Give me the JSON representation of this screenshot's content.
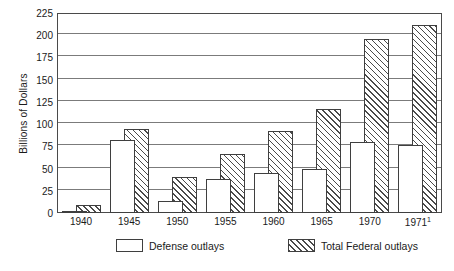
{
  "chart_data": {
    "type": "bar",
    "title": "",
    "xlabel": "",
    "ylabel": "Billions of Dollars",
    "ylim": [
      0,
      225
    ],
    "ytick_step": 25,
    "yticks": [
      0,
      25,
      50,
      75,
      100,
      125,
      150,
      175,
      200,
      225
    ],
    "grid": true,
    "grid_axis": "y",
    "legend_position": "bottom",
    "categories": [
      "1940",
      "1945",
      "1950",
      "1955",
      "1960",
      "1965",
      "1970",
      "1971¹"
    ],
    "series": [
      {
        "name": "Defense outlays",
        "values": [
          2,
          82,
          13,
          38,
          45,
          49,
          80,
          76
        ],
        "style": "open"
      },
      {
        "name": "Total Federal outlays",
        "values": [
          9,
          95,
          40,
          66,
          92,
          117,
          196,
          212
        ],
        "style": "hatched"
      }
    ],
    "footnote_marker": "1"
  },
  "axis": {
    "y_title": "Billions of Dollars",
    "y_tick_labels": [
      "225",
      "200",
      "175",
      "150",
      "125",
      "100",
      "75",
      "50",
      "25",
      "0"
    ],
    "x_tick_labels": [
      "1940",
      "1945",
      "1950",
      "1955",
      "1960",
      "1965",
      "1970",
      "1971"
    ],
    "x_last_superscript": "1"
  },
  "legend": {
    "items": [
      {
        "label": "Defense outlays",
        "icon": "open-square-swatch"
      },
      {
        "label": "Total Federal outlays",
        "icon": "hatched-square-swatch"
      }
    ]
  },
  "colors": {
    "frame": "#4a4a4a",
    "gridline": "#7b7b7b",
    "bar_outline": "#3f3f3f",
    "hatch": "#4a4a4a",
    "background": "#ffffff"
  }
}
